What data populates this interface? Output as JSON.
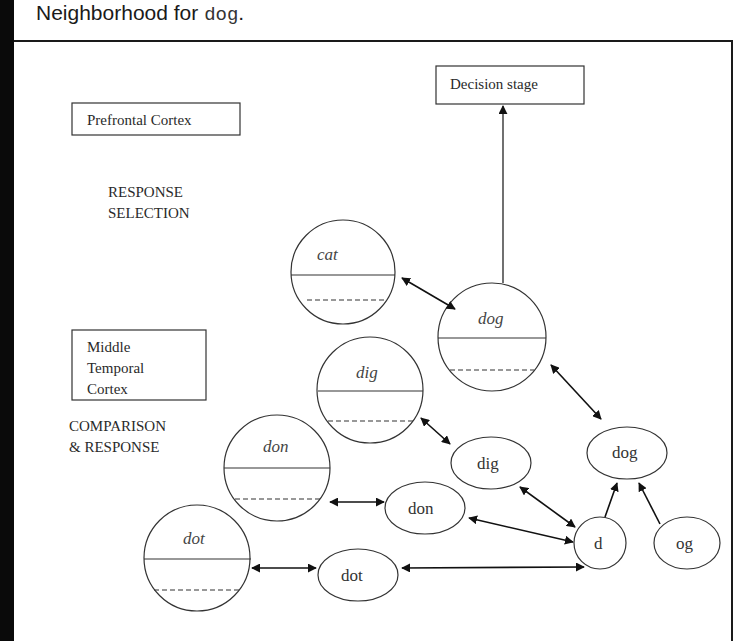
{
  "caption": {
    "prefix": "Neighborhood for ",
    "word": "dog",
    "suffix": "."
  },
  "regions": {
    "prefrontal": {
      "label": "Prefrontal Cortex",
      "stage": [
        "RESPONSE",
        "SELECTION"
      ]
    },
    "middle_temporal": {
      "label": [
        "Middle",
        "Temporal",
        "Cortex"
      ],
      "stage": [
        "COMPARISON",
        "& RESPONSE"
      ]
    },
    "decision": {
      "label": "Decision stage"
    }
  },
  "word_nodes": [
    {
      "id": "cat",
      "label": "cat"
    },
    {
      "id": "dog",
      "label": "dog"
    },
    {
      "id": "dig",
      "label": "dig"
    },
    {
      "id": "don",
      "label": "don"
    },
    {
      "id": "dot",
      "label": "dot"
    }
  ],
  "form_nodes": [
    {
      "id": "dog_form",
      "label": "dog"
    },
    {
      "id": "dig_form",
      "label": "dig"
    },
    {
      "id": "don_form",
      "label": "don"
    },
    {
      "id": "dot_form",
      "label": "dot"
    },
    {
      "id": "d",
      "label": "d"
    },
    {
      "id": "og",
      "label": "og"
    }
  ],
  "edges": [
    {
      "from": "dog",
      "to": "Decision stage",
      "type": "one-way"
    },
    {
      "from": "cat",
      "to": "dog",
      "type": "two-way"
    },
    {
      "from": "dog",
      "to": "dog_form",
      "type": "two-way"
    },
    {
      "from": "dig",
      "to": "dig_form",
      "type": "two-way"
    },
    {
      "from": "don",
      "to": "don_form",
      "type": "two-way"
    },
    {
      "from": "dot",
      "to": "dot_form",
      "type": "two-way"
    },
    {
      "from": "dig_form",
      "to": "d",
      "type": "two-way"
    },
    {
      "from": "don_form",
      "to": "d",
      "type": "two-way"
    },
    {
      "from": "dot_form",
      "to": "d",
      "type": "two-way"
    },
    {
      "from": "d",
      "to": "dog_form",
      "type": "one-way"
    },
    {
      "from": "og",
      "to": "dog_form",
      "type": "one-way"
    }
  ]
}
